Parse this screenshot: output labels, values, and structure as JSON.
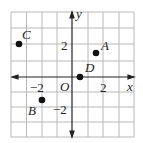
{
  "diagram": {
    "type": "coordinate-plane",
    "grid": {
      "x_min": -4,
      "x_max": 4,
      "y_min": -4,
      "y_max": 4,
      "step": 1
    },
    "axes": {
      "x_label": "x",
      "y_label": "y",
      "origin_label": "O"
    },
    "ticks": {
      "x_neg": "−2",
      "x_pos": "2",
      "y_pos": "2",
      "y_neg": "−2"
    },
    "points": [
      {
        "name": "A",
        "x": 1.5,
        "y": 1.5
      },
      {
        "name": "B",
        "x": -2,
        "y": -1.5
      },
      {
        "name": "C",
        "x": -3.5,
        "y": 2
      },
      {
        "name": "D",
        "x": 0.5,
        "y": 0
      }
    ],
    "colors": {
      "grid": "#b8b8b8",
      "axis": "#222222",
      "point": "#111111"
    }
  }
}
